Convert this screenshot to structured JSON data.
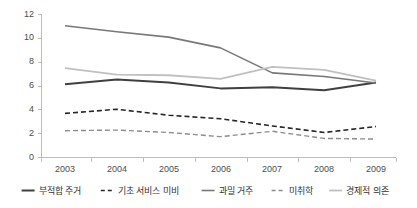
{
  "chart_data": {
    "type": "line",
    "title": "",
    "xlabel": "",
    "ylabel": "",
    "categories": [
      "2003",
      "2004",
      "2005",
      "2006",
      "2007",
      "2008",
      "2009"
    ],
    "x": [
      2003,
      2004,
      2005,
      2006,
      2007,
      2008,
      2009
    ],
    "ylim": [
      0,
      12
    ],
    "yticks": [
      0,
      2,
      4,
      6,
      8,
      10,
      12
    ],
    "ytick_labels": [
      "0",
      "2",
      "4",
      "6",
      "8",
      "10",
      "12"
    ],
    "grid": false,
    "legend_position": "bottom",
    "series": [
      {
        "name": "부적합 주거",
        "values": [
          6.15,
          6.55,
          6.3,
          5.8,
          5.9,
          5.65,
          6.3
        ],
        "color": "#404040",
        "style": "solid",
        "width": 2.0
      },
      {
        "name": "기초 서비스 미비",
        "values": [
          3.7,
          4.05,
          3.55,
          3.25,
          2.65,
          2.1,
          2.6
        ],
        "color": "#262626",
        "style": "dashed",
        "width": 1.6
      },
      {
        "name": "과밀 거주",
        "values": [
          11.05,
          10.55,
          10.1,
          9.2,
          7.1,
          6.8,
          6.25
        ],
        "color": "#787878",
        "style": "solid",
        "width": 1.6
      },
      {
        "name": "미취학",
        "values": [
          2.25,
          2.3,
          2.1,
          1.75,
          2.2,
          1.6,
          1.55
        ],
        "color": "#8c8c8c",
        "style": "dashed",
        "width": 1.4
      },
      {
        "name": "경제적 의존",
        "values": [
          7.5,
          6.95,
          6.9,
          6.6,
          7.6,
          7.35,
          6.45
        ],
        "color": "#c0c0c0",
        "style": "solid",
        "width": 1.8
      }
    ]
  },
  "axis": {
    "y_tick_0": "0",
    "y_tick_1": "2",
    "y_tick_2": "4",
    "y_tick_3": "6",
    "y_tick_4": "8",
    "y_tick_5": "10",
    "y_tick_6": "12",
    "x_tick_0": "2003",
    "x_tick_1": "2004",
    "x_tick_2": "2005",
    "x_tick_3": "2006",
    "x_tick_4": "2007",
    "x_tick_5": "2008",
    "x_tick_6": "2009"
  },
  "legend": {
    "item_0": "부적합 주거",
    "item_1": "기초 서비스 미비",
    "item_2": "과밀 거주",
    "item_3": "미취학",
    "item_4": "경제적 의존"
  }
}
